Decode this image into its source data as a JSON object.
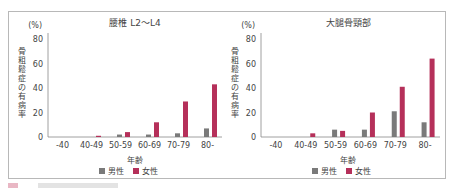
{
  "chart_data": [
    {
      "type": "bar",
      "title": "腰椎 L2〜L4",
      "ylabel": "骨粗鬆症の有病率",
      "yunit": "(%)",
      "xlabel": "年齢",
      "ylim": [
        0,
        80
      ],
      "yticks": [
        0,
        20,
        40,
        60,
        80
      ],
      "categories": [
        "-40",
        "40-49",
        "50-59",
        "60-69",
        "70-79",
        "80-"
      ],
      "series": [
        {
          "name": "男性",
          "color": "#7a7a7a",
          "values": [
            0,
            0,
            2,
            2,
            3,
            7
          ]
        },
        {
          "name": "女性",
          "color": "#b5305a",
          "values": [
            0,
            1,
            4,
            12,
            29,
            43
          ]
        }
      ],
      "legend": "bottom"
    },
    {
      "type": "bar",
      "title": "大腿骨頸部",
      "ylabel": "骨粗鬆症の有病率",
      "yunit": "(%)",
      "xlabel": "年齢",
      "ylim": [
        0,
        80
      ],
      "yticks": [
        0,
        20,
        40,
        60,
        80
      ],
      "categories": [
        "-40",
        "40-49",
        "50-59",
        "60-69",
        "70-79",
        "80-"
      ],
      "series": [
        {
          "name": "男性",
          "color": "#7a7a7a",
          "values": [
            0,
            0,
            6,
            6,
            21,
            12
          ]
        },
        {
          "name": "女性",
          "color": "#b5305a",
          "values": [
            0,
            3,
            5,
            20,
            41,
            64
          ]
        }
      ],
      "legend": "bottom"
    }
  ]
}
